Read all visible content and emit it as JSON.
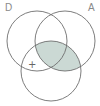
{
  "diagram": {
    "type": "venn",
    "labels": {
      "left": "D",
      "right": "A"
    },
    "marker": "+",
    "circles": [
      {
        "name": "D",
        "cx": 37,
        "cy": 41,
        "r": 30
      },
      {
        "name": "A",
        "cx": 65,
        "cy": 41,
        "r": 30
      },
      {
        "name": "bottom",
        "cx": 51,
        "cy": 71,
        "r": 30
      }
    ],
    "shaded_region": "A ∩ bottom",
    "colors": {
      "shade": "#cbd9d4",
      "stroke": "#6e6e6e",
      "label": "#8a8a8a"
    }
  }
}
